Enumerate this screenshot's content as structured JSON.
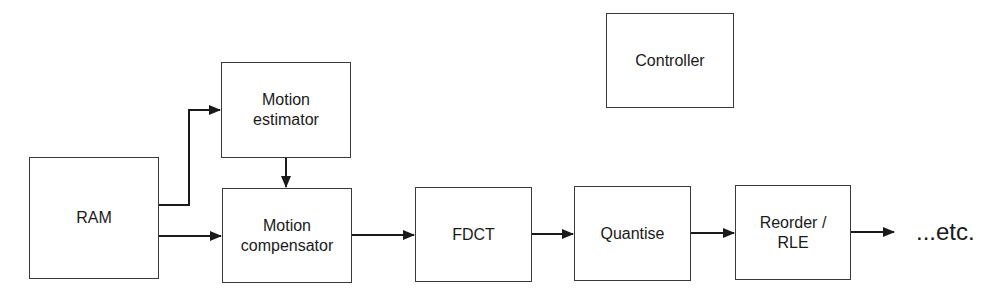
{
  "diagram": {
    "blocks": {
      "ram": {
        "label": "RAM"
      },
      "motion_estimator": {
        "line1": "Motion",
        "line2": "estimator"
      },
      "motion_compensator": {
        "line1": "Motion",
        "line2": "compensator"
      },
      "fdct": {
        "label": "FDCT"
      },
      "quantise": {
        "label": "Quantise"
      },
      "reorder_rle": {
        "line1": "Reorder /",
        "line2": "RLE"
      },
      "controller": {
        "label": "Controller"
      }
    },
    "continuation_label": "...etc.",
    "connections": [
      {
        "from": "RAM",
        "to": "Motion estimator"
      },
      {
        "from": "RAM",
        "to": "Motion compensator"
      },
      {
        "from": "Motion estimator",
        "to": "Motion compensator"
      },
      {
        "from": "Motion compensator",
        "to": "FDCT"
      },
      {
        "from": "FDCT",
        "to": "Quantise"
      },
      {
        "from": "Quantise",
        "to": "Reorder / RLE"
      },
      {
        "from": "Reorder / RLE",
        "to": "...etc."
      }
    ]
  }
}
